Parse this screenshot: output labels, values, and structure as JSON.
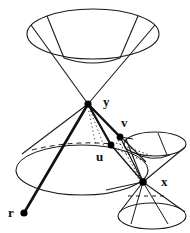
{
  "figure": {
    "background_color": "#ffffff",
    "line_color": "#1a1a1a",
    "point_color": "#000000",
    "labels": [
      {
        "id": "y",
        "text": "y",
        "x": 103,
        "y": 106
      },
      {
        "id": "v",
        "text": "v",
        "x": 121,
        "y": 127
      },
      {
        "id": "u",
        "text": "u",
        "x": 96,
        "y": 161
      },
      {
        "id": "x",
        "text": "x",
        "x": 161,
        "y": 186
      },
      {
        "id": "r",
        "text": "r",
        "x": 8,
        "y": 217
      }
    ],
    "points": [
      {
        "id": "y",
        "cx": 88,
        "cy": 104,
        "r": 3.6
      },
      {
        "id": "v",
        "cx": 120,
        "cy": 137,
        "r": 3.4
      },
      {
        "id": "u",
        "cx": 111,
        "cy": 145,
        "r": 3.4
      },
      {
        "id": "x",
        "cx": 143,
        "cy": 182,
        "r": 3.8
      },
      {
        "id": "r",
        "cx": 24,
        "cy": 213,
        "r": 3.6
      }
    ],
    "shapes": {
      "upper_cone": {
        "name": "upper-light-cone",
        "ellipse": {
          "cx": 93,
          "cy": 34,
          "rx": 66,
          "ry": 25
        },
        "apex": {
          "x": 88,
          "y": 104
        }
      },
      "lower_big_cone": {
        "name": "lower-light-cone",
        "ellipse": {
          "cx": 82,
          "cy": 170,
          "rx": 66,
          "ry": 25
        },
        "apex": {
          "x": 88,
          "y": 104
        }
      },
      "small_upper_cone": {
        "name": "small-upper-cone",
        "ellipse": {
          "cx": 155,
          "cy": 144,
          "rx": 31,
          "ry": 12
        },
        "apex": {
          "x": 143,
          "y": 182
        }
      },
      "small_lower_cone": {
        "name": "small-lower-cone",
        "ellipse": {
          "cx": 152,
          "cy": 216,
          "rx": 34,
          "ry": 13
        },
        "apex": {
          "x": 143,
          "y": 182
        }
      }
    },
    "segments": [
      {
        "id": "y-r",
        "from": "y",
        "to": "r",
        "style": "thick-solid"
      },
      {
        "id": "y-u",
        "from": "y",
        "to": "u",
        "style": "thick-solid"
      },
      {
        "id": "y-v",
        "from": "y",
        "to": "v",
        "style": "thick-solid"
      },
      {
        "id": "v-x",
        "from": "v",
        "to": "x",
        "style": "thin-solid"
      },
      {
        "id": "u-x",
        "from": "u",
        "to": "x",
        "style": "thin-solid"
      },
      {
        "id": "y-u-dotted",
        "from": "y",
        "to": "u",
        "style": "dotted"
      }
    ],
    "hidden_arcs": [
      {
        "id": "big-cone-back-arc",
        "style": "dashed"
      },
      {
        "id": "small-cone-back-arc",
        "style": "dashed"
      }
    ]
  }
}
